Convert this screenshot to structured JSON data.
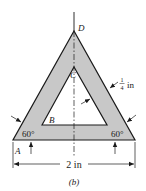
{
  "figure": {
    "caption": "(b)",
    "points": {
      "A": "A",
      "B": "B",
      "C": "C",
      "D": "D"
    },
    "angles": {
      "left": "60°",
      "right": "60°"
    },
    "dimensions": {
      "thickness_num": "1",
      "thickness_den": "4",
      "thickness_unit": "in",
      "base_width": "2 in"
    },
    "colors": {
      "fill": "#c8c8c8",
      "stroke": "#1a1a1a",
      "background": "#ffffff"
    }
  }
}
